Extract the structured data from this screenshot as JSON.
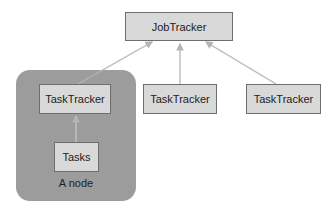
{
  "diagram": {
    "job_tracker": {
      "label": "JobTracker"
    },
    "node": {
      "label": "A node",
      "task_tracker": {
        "label": "TaskTracker"
      },
      "tasks": {
        "label": "Tasks"
      }
    },
    "task_trackers": [
      {
        "label": "TaskTracker"
      },
      {
        "label": "TaskTracker"
      }
    ],
    "colors": {
      "box_fill": "#d9d9d9",
      "box_border": "#6e6e6e",
      "node_fill": "#9c9c9c",
      "arrow": "#b5b5b5"
    }
  }
}
